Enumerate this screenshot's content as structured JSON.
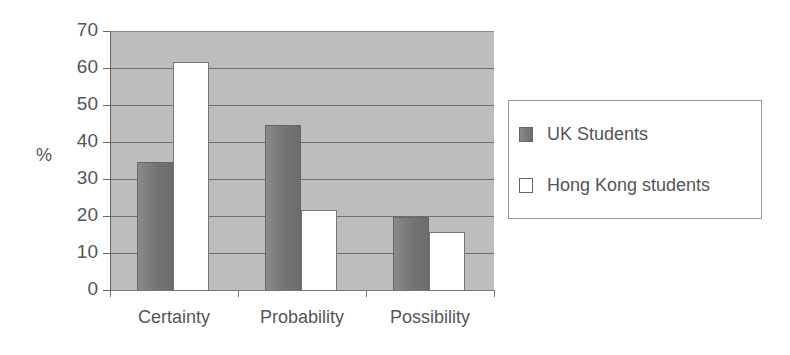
{
  "chart_data": {
    "type": "bar",
    "title": "",
    "xlabel": "",
    "ylabel": "%",
    "ylim": [
      0,
      70
    ],
    "yticks": [
      0,
      10,
      20,
      30,
      40,
      50,
      60,
      70
    ],
    "grid": true,
    "legend_position": "right",
    "categories": [
      "Certainty",
      "Probability",
      "Possibility"
    ],
    "series": [
      {
        "name": "UK Students",
        "color": "#777777",
        "values": [
          35,
          45,
          20
        ]
      },
      {
        "name": "Hong Kong students",
        "color": "#ffffff",
        "values": [
          62,
          22,
          16
        ]
      }
    ]
  },
  "axis": {
    "y_title": "%",
    "y_ticks": [
      "0",
      "10",
      "20",
      "30",
      "40",
      "50",
      "60",
      "70"
    ]
  },
  "legend": {
    "items": [
      {
        "label": "UK Students"
      },
      {
        "label": "Hong Kong students"
      }
    ]
  }
}
